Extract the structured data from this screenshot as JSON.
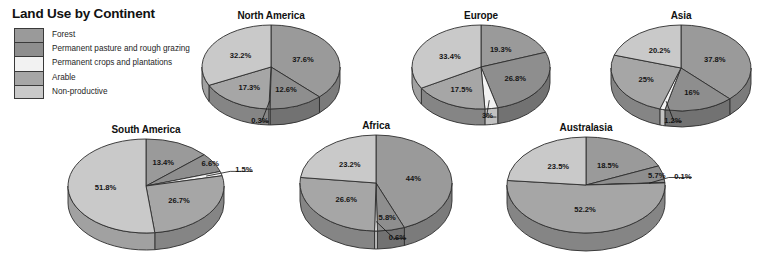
{
  "title": "Land Use by Continent",
  "legend": {
    "items": [
      {
        "label": "Forest",
        "color": "#9a9a9a"
      },
      {
        "label": "Permanent pasture and rough grazing",
        "color": "#8e8e8e"
      },
      {
        "label": "Permanent crops and plantations",
        "color": "#f2f2f2"
      },
      {
        "label": "Arable",
        "color": "#a6a6a6"
      },
      {
        "label": "Non-productive",
        "color": "#c9c9c9"
      }
    ]
  },
  "chart_data": {
    "type": "pie",
    "title": "Land Use by Continent",
    "legend_position": "left",
    "unit": "%",
    "categories": [
      "Forest",
      "Permanent pasture and rough grazing",
      "Permanent crops and plantations",
      "Arable",
      "Non-productive"
    ],
    "colors": [
      "#9a9a9a",
      "#8e8e8e",
      "#f2f2f2",
      "#a6a6a6",
      "#c9c9c9"
    ],
    "charts": [
      {
        "name": "North America",
        "values": [
          37.6,
          12.6,
          0.3,
          17.3,
          32.2
        ],
        "labels": [
          "37.6%",
          "12.6%",
          "0.3%",
          "17.3%",
          "32.2%"
        ]
      },
      {
        "name": "Europe",
        "values": [
          19.3,
          26.8,
          3.0,
          17.5,
          33.4
        ],
        "labels": [
          "19.3%",
          "26.8%",
          "3%",
          "17.5%",
          "33.4%"
        ]
      },
      {
        "name": "Asia",
        "values": [
          37.8,
          16.0,
          1.2,
          25.0,
          20.2
        ],
        "labels": [
          "37.8%",
          "16%",
          "1.2%",
          "25%",
          "20.2%"
        ]
      },
      {
        "name": "South America",
        "values": [
          13.4,
          6.6,
          1.5,
          26.7,
          51.8
        ],
        "labels": [
          "13.4%",
          "6.6%",
          "1.5%",
          "26.7%",
          "51.8%"
        ]
      },
      {
        "name": "Africa",
        "values": [
          44.0,
          5.8,
          0.6,
          26.6,
          23.2
        ],
        "labels": [
          "44%",
          "5.8%",
          "0.6%",
          "26.6%",
          "23.2%"
        ]
      },
      {
        "name": "Australasia",
        "values": [
          18.5,
          5.7,
          0.1,
          52.2,
          23.5
        ],
        "labels": [
          "18.5%",
          "5.7%",
          "0.1%",
          "52.2%",
          "23.5%"
        ]
      }
    ]
  },
  "pies": {
    "north_america": {
      "title": "North America"
    },
    "europe": {
      "title": "Europe"
    },
    "asia": {
      "title": "Asia"
    },
    "south_america": {
      "title": "South America"
    },
    "africa": {
      "title": "Africa"
    },
    "australasia": {
      "title": "Australasia"
    }
  }
}
